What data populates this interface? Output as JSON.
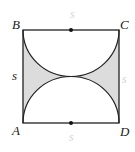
{
  "diagram": {
    "vertices": [
      {
        "name": "B",
        "label": "B"
      },
      {
        "name": "C",
        "label": "C"
      },
      {
        "name": "A",
        "label": "A"
      },
      {
        "name": "D",
        "label": "D"
      }
    ],
    "side_labels": {
      "left": "s",
      "top": "s",
      "right": "s",
      "bottom": "s"
    },
    "colors": {
      "stroke": "#222222",
      "shaded": "#dcdcdc",
      "faint_label": "#d4d4d4"
    }
  }
}
